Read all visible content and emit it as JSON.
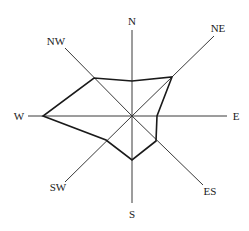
{
  "chart_data": {
    "type": "radar",
    "title": "",
    "center": [
      132,
      116
    ],
    "axes": [
      {
        "key": "n",
        "label": "N",
        "end": [
          132,
          30
        ],
        "label_pos": [
          132,
          25
        ],
        "anchor": "middle"
      },
      {
        "key": "ne",
        "label": "NE",
        "end": [
          214,
          36
        ],
        "label_pos": [
          218,
          32
        ],
        "anchor": "middle"
      },
      {
        "key": "e",
        "label": "E",
        "end": [
          227,
          116
        ],
        "label_pos": [
          236,
          120
        ],
        "anchor": "middle"
      },
      {
        "key": "es",
        "label": "ES",
        "end": [
          203,
          185
        ],
        "label_pos": [
          210,
          195
        ],
        "anchor": "middle"
      },
      {
        "key": "s",
        "label": "S",
        "end": [
          132,
          203
        ],
        "label_pos": [
          132,
          218
        ],
        "anchor": "middle"
      },
      {
        "key": "sw",
        "label": "SW",
        "end": [
          65,
          182
        ],
        "label_pos": [
          58,
          191
        ],
        "anchor": "middle"
      },
      {
        "key": "w",
        "label": "W",
        "end": [
          28,
          116
        ],
        "label_pos": [
          19,
          120
        ],
        "anchor": "middle"
      },
      {
        "key": "nw",
        "label": "NW",
        "end": [
          65,
          48
        ],
        "label_pos": [
          56,
          45
        ],
        "anchor": "middle"
      }
    ],
    "categories": [
      "N",
      "NE",
      "E",
      "ES",
      "S",
      "SW",
      "W",
      "NW"
    ],
    "series": [
      {
        "name": "wind",
        "values": [
          35,
          56,
          25,
          35,
          44,
          35,
          89,
          54
        ],
        "points": [
          [
            132,
            81
          ],
          [
            172,
            77
          ],
          [
            157,
            116
          ],
          [
            156,
            141
          ],
          [
            132,
            160
          ],
          [
            106,
            140
          ],
          [
            43,
            116
          ],
          [
            94,
            78
          ]
        ]
      }
    ],
    "legend": null,
    "grid": false,
    "ylim": [
      0,
      100
    ]
  }
}
